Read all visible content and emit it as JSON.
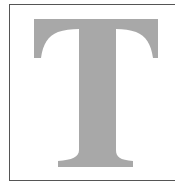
{
  "figure": {
    "letter": "T",
    "letter_color": "#a8a8a8",
    "border_color": "#555555",
    "background": "#ffffff"
  }
}
